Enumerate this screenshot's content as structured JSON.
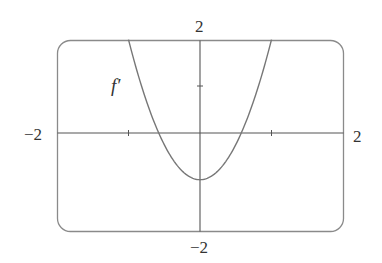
{
  "chart_data": {
    "type": "line",
    "title": "",
    "series": [
      {
        "name": "f'",
        "formula": "3x^2 - 1",
        "x": [
          -1.0,
          -0.8,
          -0.6,
          -0.5774,
          -0.4,
          -0.2,
          0.0,
          0.2,
          0.4,
          0.5774,
          0.6,
          0.8,
          1.0
        ],
        "values": [
          2.0,
          0.92,
          0.08,
          0.0,
          -0.52,
          -0.88,
          -1.0,
          -0.88,
          -0.52,
          0.0,
          0.08,
          0.92,
          2.0
        ]
      }
    ],
    "xlim": [
      -2,
      2
    ],
    "ylim": [
      -2,
      2
    ],
    "x_ticks": [
      -1,
      1
    ],
    "y_ticks": [
      1
    ],
    "xlabel": "",
    "ylabel": "",
    "grid": false,
    "legend": "none",
    "annotations": [
      {
        "text": "f′",
        "x": -1.2,
        "y": 1.0
      }
    ]
  },
  "labels": {
    "x_min": "−2",
    "x_max": "2",
    "y_max": "2",
    "y_min": "−2",
    "curve": "f′"
  },
  "colors": {
    "frame": "#888888",
    "axis": "#555555",
    "curve": "#777777"
  }
}
